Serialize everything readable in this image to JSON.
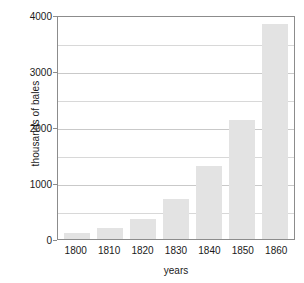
{
  "chart_data": {
    "type": "bar",
    "title": "",
    "xlabel": "years",
    "ylabel": "thousands of bales",
    "categories": [
      "1800",
      "1810",
      "1820",
      "1830",
      "1840",
      "1850",
      "1860"
    ],
    "values": [
      100,
      200,
      350,
      720,
      1300,
      2130,
      3840
    ],
    "ylim": [
      0,
      4000
    ],
    "yticks": [
      "0",
      "1000",
      "2000",
      "3000",
      "4000"
    ],
    "ytick_values": [
      0,
      1000,
      2000,
      3000,
      4000
    ],
    "minor_gridlines": [
      500,
      1500,
      2500,
      3500
    ],
    "grid": true,
    "legend": null,
    "bar_color": "#e3e3e3",
    "axis_color": "#8c8c8c",
    "grid_color": "#c9c9c9",
    "text_color": "#1a1a1a"
  }
}
